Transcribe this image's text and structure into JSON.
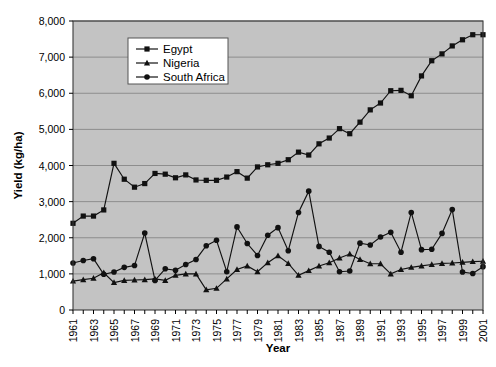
{
  "chart_data": {
    "type": "line",
    "title": "",
    "xlabel": "Year",
    "ylabel": "Yield (kg/ha)",
    "xlim": [
      1961,
      2001
    ],
    "ylim": [
      0,
      8000
    ],
    "ytick_labels": [
      "0",
      "1,000",
      "2,000",
      "3,000",
      "4,000",
      "5,000",
      "6,000",
      "7,000",
      "8,000"
    ],
    "ytick_values": [
      0,
      1000,
      2000,
      3000,
      4000,
      5000,
      6000,
      7000,
      8000
    ],
    "xtick_labels": [
      "1961",
      "1963",
      "1965",
      "1967",
      "1969",
      "1971",
      "1973",
      "1975",
      "1977",
      "1979",
      "1981",
      "1983",
      "1985",
      "1987",
      "1989",
      "1991",
      "1993",
      "1995",
      "1997",
      "1999",
      "2001"
    ],
    "x": [
      1961,
      1962,
      1963,
      1964,
      1965,
      1966,
      1967,
      1968,
      1969,
      1970,
      1971,
      1972,
      1973,
      1974,
      1975,
      1976,
      1977,
      1978,
      1979,
      1980,
      1981,
      1982,
      1983,
      1984,
      1985,
      1986,
      1987,
      1988,
      1989,
      1990,
      1991,
      1992,
      1993,
      1994,
      1995,
      1996,
      1997,
      1998,
      1999,
      2000,
      2001
    ],
    "grid": true,
    "legend_position": "top-center",
    "plot_background": "#c3c3c3",
    "series": [
      {
        "name": "Egypt",
        "marker": "square",
        "color": "#111111",
        "values": [
          2400,
          2600,
          2600,
          2770,
          4060,
          3620,
          3400,
          3500,
          3780,
          3760,
          3660,
          3740,
          3600,
          3590,
          3590,
          3680,
          3830,
          3650,
          3960,
          4020,
          4060,
          4160,
          4370,
          4290,
          4600,
          4760,
          5020,
          4880,
          5200,
          5540,
          5730,
          6070,
          6080,
          5930,
          6480,
          6900,
          7090,
          7310,
          7480,
          7620,
          7620
        ]
      },
      {
        "name": "Nigeria",
        "marker": "triangle",
        "color": "#111111",
        "values": [
          800,
          840,
          880,
          1030,
          760,
          820,
          830,
          840,
          860,
          820,
          960,
          1000,
          1000,
          560,
          600,
          860,
          1120,
          1220,
          1060,
          1310,
          1500,
          1290,
          960,
          1090,
          1220,
          1310,
          1440,
          1550,
          1400,
          1280,
          1280,
          1000,
          1120,
          1180,
          1220,
          1260,
          1290,
          1300,
          1320,
          1340,
          1350
        ]
      },
      {
        "name": "South Africa",
        "marker": "circle",
        "color": "#111111",
        "values": [
          1300,
          1370,
          1420,
          990,
          1050,
          1180,
          1230,
          2130,
          820,
          1140,
          1100,
          1260,
          1400,
          1780,
          1930,
          1060,
          2300,
          1840,
          1510,
          2070,
          2280,
          1640,
          2700,
          3290,
          1760,
          1600,
          1060,
          1080,
          1850,
          1800,
          2020,
          2150,
          1600,
          2700,
          1670,
          1680,
          2120,
          2780,
          1050,
          1010,
          1200
        ]
      }
    ]
  },
  "legend": {
    "items": [
      {
        "label": "Egypt",
        "marker": "square"
      },
      {
        "label": "Nigeria",
        "marker": "triangle"
      },
      {
        "label": "South Africa",
        "marker": "circle"
      }
    ]
  }
}
